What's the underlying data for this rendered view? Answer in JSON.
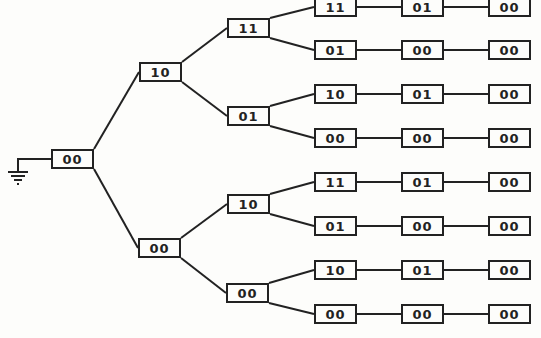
{
  "diagram": {
    "type": "state-tree",
    "root": {
      "label": "00",
      "x": 51,
      "y": 149
    },
    "level1": [
      {
        "label": "10",
        "x": 139,
        "y": 62
      },
      {
        "label": "00",
        "x": 138,
        "y": 238
      }
    ],
    "level2": [
      {
        "label": "11",
        "x": 227,
        "y": 18
      },
      {
        "label": "01",
        "x": 227,
        "y": 106
      },
      {
        "label": "10",
        "x": 227,
        "y": 194
      },
      {
        "label": "00",
        "x": 226,
        "y": 283
      }
    ],
    "rows": [
      {
        "cells": [
          "11",
          "01",
          "00"
        ],
        "y": -3
      },
      {
        "cells": [
          "01",
          "00",
          "00"
        ],
        "y": 40
      },
      {
        "cells": [
          "10",
          "01",
          "00"
        ],
        "y": 84
      },
      {
        "cells": [
          "00",
          "00",
          "00"
        ],
        "y": 128
      },
      {
        "cells": [
          "11",
          "01",
          "00"
        ],
        "y": 172
      },
      {
        "cells": [
          "01",
          "00",
          "00"
        ],
        "y": 216
      },
      {
        "cells": [
          "10",
          "01",
          "00"
        ],
        "y": 260
      },
      {
        "cells": [
          "00",
          "00",
          "00"
        ],
        "y": 304
      }
    ],
    "columns_x": [
      314,
      401,
      488
    ],
    "ground_symbol": "ground-icon",
    "line_color": "#222222"
  }
}
